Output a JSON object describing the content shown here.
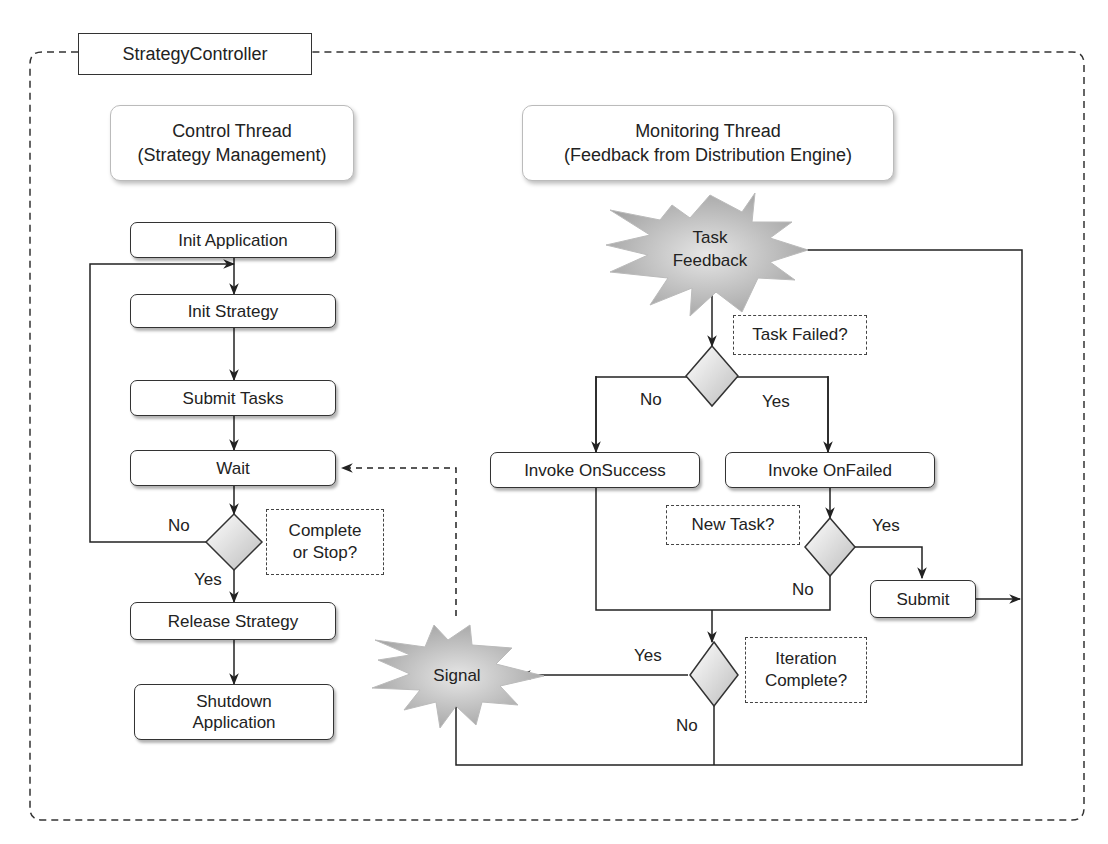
{
  "container": {
    "title": "StrategyController"
  },
  "control_thread": {
    "header": [
      "Control Thread",
      "(Strategy Management)"
    ],
    "steps": [
      "Init Application",
      "Init Strategy",
      "Submit Tasks",
      "Wait",
      "Release Strategy",
      "Shutdown Application"
    ],
    "shutdown_lines": [
      "Shutdown",
      "Application"
    ],
    "decision_note": [
      "Complete",
      "or Stop?"
    ],
    "decision_no": "No",
    "decision_yes": "Yes"
  },
  "monitoring_thread": {
    "header": [
      "Monitoring Thread",
      "(Feedback from Distribution Engine)"
    ],
    "event_lines": [
      "Task",
      "Feedback"
    ],
    "task_failed_note": "Task Failed?",
    "task_failed_no": "No",
    "task_failed_yes": "Yes",
    "on_success": "Invoke OnSuccess",
    "on_failed": "Invoke OnFailed",
    "new_task_note": "New Task?",
    "new_task_yes": "Yes",
    "new_task_no": "No",
    "submit": "Submit",
    "iteration_note": [
      "Iteration",
      "Complete?"
    ],
    "iteration_yes": "Yes",
    "iteration_no": "No",
    "signal": "Signal"
  }
}
